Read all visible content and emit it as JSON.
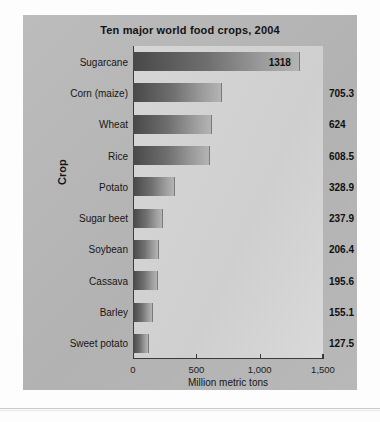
{
  "chart_data": {
    "type": "bar",
    "orientation": "horizontal",
    "title": "Ten major world food crops, 2004",
    "xlabel": "Million metric tons",
    "ylabel": "Crop",
    "xlim": [
      0,
      1500
    ],
    "xticks": [
      0,
      500,
      1000,
      1500
    ],
    "xtick_labels": [
      "0",
      "500",
      "1,000",
      "1,500"
    ],
    "grid": false,
    "legend": null,
    "categories": [
      "Sugarcane",
      "Corn (maize)",
      "Wheat",
      "Rice",
      "Potato",
      "Sugar beet",
      "Soybean",
      "Cassava",
      "Barley",
      "Sweet potato"
    ],
    "values": [
      1318,
      705.3,
      624,
      608.5,
      328.9,
      237.9,
      206.4,
      195.6,
      155.1,
      127.5
    ],
    "value_labels": [
      "1318",
      "705.3",
      "624",
      "608.5",
      "328.9",
      "237.9",
      "206.4",
      "195.6",
      "155.1",
      "127.5"
    ],
    "bars": [
      {
        "category": "Sugarcane",
        "value": 1318,
        "label": "1318",
        "label_position": "inside"
      },
      {
        "category": "Corn (maize)",
        "value": 705.3,
        "label": "705.3",
        "label_position": "outside"
      },
      {
        "category": "Wheat",
        "value": 624,
        "label": "624",
        "label_position": "outside"
      },
      {
        "category": "Rice",
        "value": 608.5,
        "label": "608.5",
        "label_position": "outside"
      },
      {
        "category": "Potato",
        "value": 328.9,
        "label": "328.9",
        "label_position": "outside"
      },
      {
        "category": "Sugar beet",
        "value": 237.9,
        "label": "237.9",
        "label_position": "outside"
      },
      {
        "category": "Soybean",
        "value": 206.4,
        "label": "206.4",
        "label_position": "outside"
      },
      {
        "category": "Cassava",
        "value": 195.6,
        "label": "195.6",
        "label_position": "outside"
      },
      {
        "category": "Barley",
        "value": 155.1,
        "label": "155.1",
        "label_position": "outside"
      },
      {
        "category": "Sweet potato",
        "value": 127.5,
        "label": "127.5",
        "label_position": "outside"
      }
    ],
    "colors": {
      "bar_gradient_start": "#484848",
      "bar_gradient_end": "#b4b4b4",
      "plot_background": "#d2d2d2",
      "card_background": "#b6b6b6",
      "axis": "#3a3a3a",
      "text": "#131313"
    }
  }
}
